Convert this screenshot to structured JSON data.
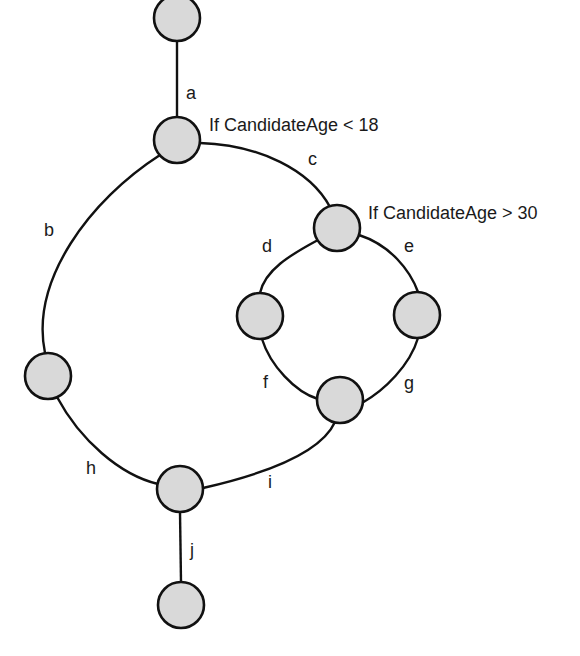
{
  "diagram": {
    "type": "control-flow-graph",
    "node_fill": "#d9d9d9",
    "stroke": "#111111",
    "conditions": [
      {
        "node": "n2",
        "text": "If CandidateAge < 18"
      },
      {
        "node": "n3",
        "text": "If CandidateAge > 30"
      }
    ],
    "nodes": [
      {
        "id": "n1",
        "x": 177,
        "y": 18
      },
      {
        "id": "n2",
        "x": 177,
        "y": 140
      },
      {
        "id": "n3",
        "x": 337,
        "y": 228
      },
      {
        "id": "n4",
        "x": 260,
        "y": 316
      },
      {
        "id": "n5",
        "x": 417,
        "y": 315
      },
      {
        "id": "n6",
        "x": 340,
        "y": 400
      },
      {
        "id": "n7",
        "x": 48,
        "y": 376
      },
      {
        "id": "n8",
        "x": 180,
        "y": 489
      },
      {
        "id": "n9",
        "x": 181,
        "y": 605
      }
    ],
    "edges": [
      {
        "label": "a",
        "from": "n1",
        "to": "n2"
      },
      {
        "label": "b",
        "from": "n2",
        "to": "n7"
      },
      {
        "label": "c",
        "from": "n2",
        "to": "n3"
      },
      {
        "label": "d",
        "from": "n3",
        "to": "n4"
      },
      {
        "label": "e",
        "from": "n3",
        "to": "n5"
      },
      {
        "label": "f",
        "from": "n4",
        "to": "n6"
      },
      {
        "label": "g",
        "from": "n5",
        "to": "n6"
      },
      {
        "label": "h",
        "from": "n7",
        "to": "n8"
      },
      {
        "label": "i",
        "from": "n6",
        "to": "n8"
      },
      {
        "label": "j",
        "from": "n8",
        "to": "n9"
      }
    ]
  }
}
